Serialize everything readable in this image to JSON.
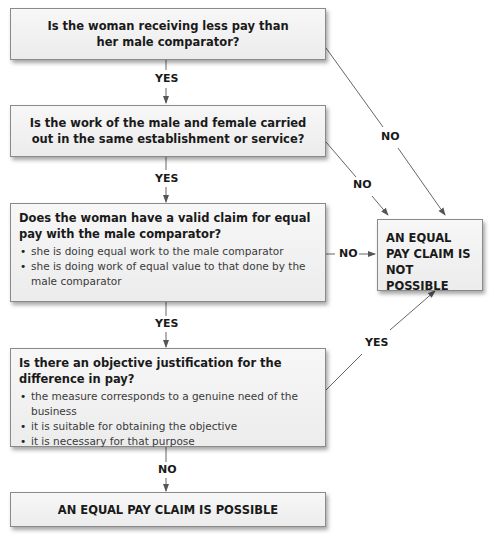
{
  "flowchart": {
    "q1": {
      "text": "Is the woman receiving less pay than her male comparator?"
    },
    "q2": {
      "text": "Is the work of the male and female carried out in the same establishment or service?"
    },
    "q3": {
      "text": "Does the woman have a valid claim for equal pay with the male comparator?",
      "bullets": [
        "she is doing equal work to the male comparator",
        "she is doing work of equal value to that done by the male comparator"
      ]
    },
    "q4": {
      "text": "Is there an objective justification for the difference in pay?",
      "bullets": [
        "the measure corresponds to a genuine need of the business",
        "it is suitable for obtaining the objective",
        "it is necessary for that purpose"
      ]
    },
    "outcome_not_possible": "AN EQUAL PAY CLAIM IS NOT POSSIBLE",
    "outcome_possible": "AN EQUAL PAY CLAIM IS POSSIBLE",
    "labels": {
      "q1_yes": "YES",
      "q2_yes": "YES",
      "q3_yes": "YES",
      "q4_no": "NO",
      "q1_no": "NO",
      "q2_no": "NO",
      "q3_no": "NO",
      "q4_yes": "YES"
    }
  }
}
